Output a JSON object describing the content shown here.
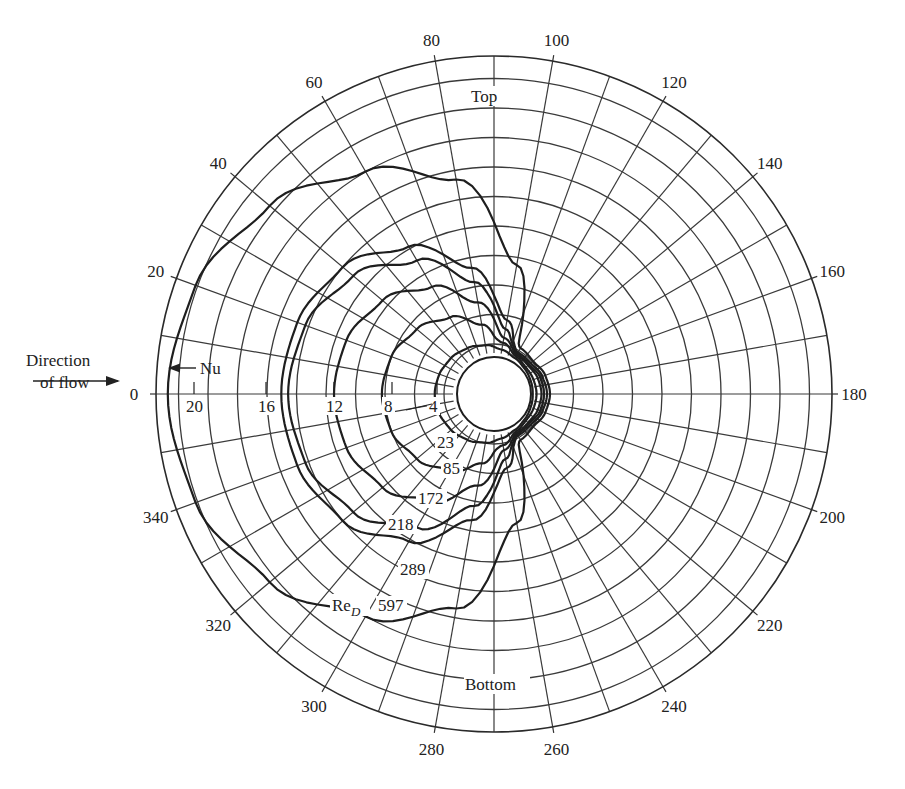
{
  "chart_data": {
    "type": "polar-line",
    "title": "",
    "angle_axis": {
      "unit": "degrees",
      "zero_direction": "left (upstream, front stagnation point)",
      "rotation": "clockwise via top",
      "major_step": 20,
      "minor_step": 10,
      "tick_labels": [
        "0",
        "20",
        "40",
        "60",
        "80",
        "100",
        "120",
        "140",
        "160",
        "180",
        "200",
        "220",
        "240",
        "260",
        "280",
        "300",
        "320",
        "340"
      ]
    },
    "radial_axis": {
      "label": "Nu",
      "tick_labels": [
        "4",
        "8",
        "12",
        "16",
        "20"
      ],
      "range": [
        0,
        22
      ]
    },
    "annotations": {
      "flow_direction": "Direction of flow",
      "nu_arrow": "Nu",
      "top": "Top",
      "bottom": "Bottom",
      "re_label": "Re",
      "re_subscript": "D"
    },
    "theta": [
      0,
      20,
      40,
      60,
      80,
      100,
      120,
      140,
      160,
      180
    ],
    "series": [
      {
        "name": "23",
        "values": [
          4.2,
          4.1,
          3.8,
          3.2,
          2.5,
          1.6,
          0.9,
          0.55,
          0.4,
          0.35
        ]
      },
      {
        "name": "85",
        "values": [
          8.7,
          8.5,
          7.9,
          6.8,
          5.2,
          3.0,
          1.3,
          0.9,
          1.0,
          1.1
        ]
      },
      {
        "name": "172",
        "values": [
          12.0,
          11.8,
          11.0,
          9.5,
          7.2,
          4.0,
          1.6,
          1.5,
          1.9,
          2.1
        ]
      },
      {
        "name": "218",
        "values": [
          14.7,
          14.4,
          13.4,
          11.6,
          8.8,
          4.8,
          1.9,
          1.8,
          2.4,
          2.6
        ]
      },
      {
        "name": "289",
        "values": [
          15.1,
          14.9,
          14.2,
          12.6,
          9.8,
          5.6,
          2.2,
          2.2,
          2.9,
          3.2
        ]
      },
      {
        "name": "597",
        "values": [
          21.5,
          21.0,
          19.6,
          17.6,
          15.4,
          10.0,
          3.2,
          2.8,
          3.5,
          3.8
        ]
      }
    ],
    "series_label": "Re_D",
    "symmetric_about": "0-180 axis"
  }
}
